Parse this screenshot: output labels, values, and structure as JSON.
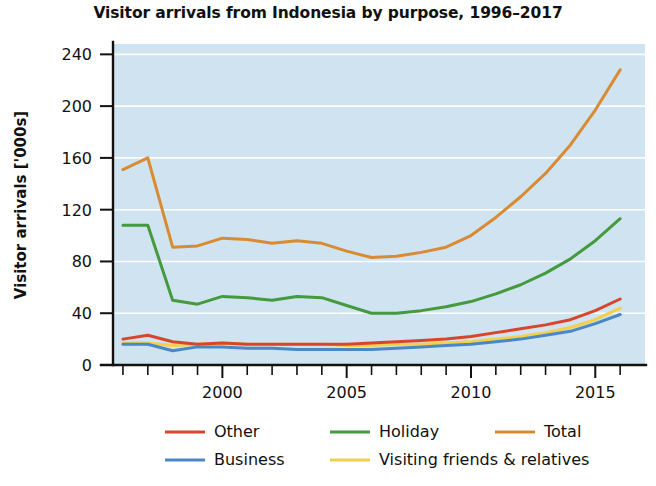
{
  "chart_data": {
    "type": "line",
    "title": "Visitor arrivals from Indonesia by purpose, 1996–2017",
    "xlabel": "",
    "ylabel": "Visitor arrivals ['000s]",
    "xlim": [
      1995.6,
      2017.0
    ],
    "ylim": [
      0,
      248
    ],
    "yticks": [
      0,
      40,
      80,
      120,
      160,
      200,
      240
    ],
    "ytick_labels": [
      "0",
      "40",
      "80",
      "120",
      "160",
      "200",
      "240"
    ],
    "xticks": [
      1996,
      1997,
      1998,
      1999,
      2000,
      2001,
      2002,
      2003,
      2004,
      2005,
      2006,
      2007,
      2008,
      2009,
      2010,
      2011,
      2012,
      2013,
      2014,
      2015,
      2016
    ],
    "xtick_labels": [
      "",
      "",
      "",
      "",
      "2000",
      "",
      "",
      "",
      "",
      "2005",
      "",
      "",
      "",
      "",
      "2010",
      "",
      "",
      "",
      "",
      "2015",
      ""
    ],
    "grid": "horizontal",
    "plot_background": "#cfe3f0",
    "gridline_color": "#ffffff",
    "legend_position": "bottom",
    "x": [
      1996,
      1997,
      1998,
      1999,
      2000,
      2001,
      2002,
      2003,
      2004,
      2005,
      2006,
      2007,
      2008,
      2009,
      2010,
      2011,
      2012,
      2013,
      2014,
      2015,
      2016
    ],
    "series": [
      {
        "name": "Other",
        "color": "#d9452a",
        "values": [
          20,
          23,
          18,
          16,
          17,
          16,
          16,
          16,
          16,
          16,
          17,
          18,
          19,
          20,
          22,
          25,
          28,
          31,
          35,
          42,
          51
        ]
      },
      {
        "name": "Business",
        "color": "#4a87c4",
        "values": [
          16,
          16,
          11,
          14,
          14,
          13,
          13,
          12,
          12,
          12,
          12,
          13,
          14,
          15,
          16,
          18,
          20,
          23,
          26,
          32,
          39
        ]
      },
      {
        "name": "Holiday",
        "color": "#449a3c",
        "values": [
          108,
          108,
          50,
          47,
          53,
          52,
          50,
          53,
          52,
          46,
          40,
          40,
          42,
          45,
          49,
          55,
          62,
          71,
          82,
          96,
          113
        ]
      },
      {
        "name": "Visiting friends & relatives",
        "color": "#f2d04a",
        "values": [
          17,
          17,
          15,
          16,
          17,
          16,
          16,
          16,
          16,
          15,
          15,
          16,
          16,
          17,
          18,
          20,
          22,
          25,
          29,
          35,
          44
        ]
      },
      {
        "name": "Total",
        "color": "#d98b33",
        "values": [
          151,
          160,
          91,
          92,
          98,
          97,
          94,
          96,
          94,
          88,
          83,
          84,
          87,
          91,
          100,
          114,
          130,
          148,
          170,
          197,
          228
        ]
      }
    ],
    "legend": [
      {
        "label": "Other",
        "color": "#d9452a",
        "row": 0,
        "col": 0
      },
      {
        "label": "Holiday",
        "color": "#449a3c",
        "row": 0,
        "col": 1
      },
      {
        "label": "Total",
        "color": "#d98b33",
        "row": 0,
        "col": 2
      },
      {
        "label": "Business",
        "color": "#4a87c4",
        "row": 1,
        "col": 0
      },
      {
        "label": "Visiting friends & relatives",
        "color": "#f2d04a",
        "row": 1,
        "col": 1
      }
    ]
  }
}
